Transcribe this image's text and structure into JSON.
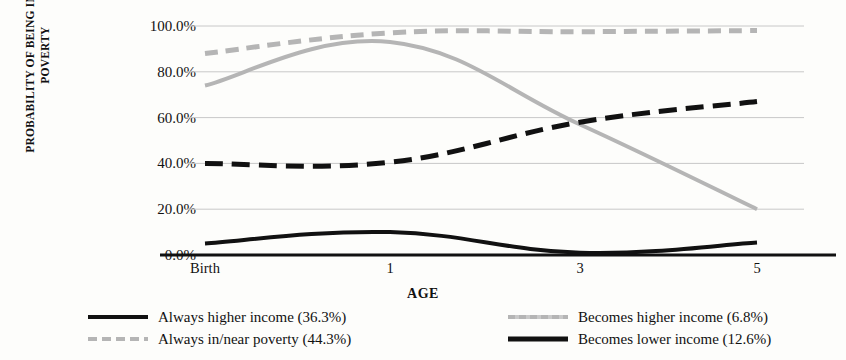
{
  "axes": {
    "y_title_line1": "PROBABILITY OF BEING IN/NEAR",
    "y_title_line2": "POVERTY",
    "x_title": "AGE",
    "y_ticks": [
      "100.0%",
      "80.0%",
      "60.0%",
      "40.0%",
      "20.0%",
      "0.0%"
    ],
    "x_ticks": [
      "Birth",
      "1",
      "3",
      "5"
    ]
  },
  "legend": {
    "left": [
      {
        "label": "Always higher income (36.3%)",
        "style": "sw-black-solid"
      },
      {
        "label": "Always in/near poverty (44.3%)",
        "style": "sw-gray-dash"
      }
    ],
    "right": [
      {
        "label": "Becomes higher income (6.8%)",
        "style": "sw-gray-solid"
      },
      {
        "label": "Becomes lower income (12.6%)",
        "style": "sw-black-dash"
      }
    ]
  },
  "chart_data": {
    "type": "line",
    "title": "",
    "xlabel": "AGE",
    "ylabel": "PROBABILITY OF BEING IN/NEAR POVERTY",
    "x": [
      0,
      1,
      3,
      5
    ],
    "x_tick_labels": [
      "Birth",
      "1",
      "3",
      "5"
    ],
    "ylim": [
      0,
      100
    ],
    "y_ticks": [
      0,
      20,
      40,
      60,
      80,
      100
    ],
    "y_unit": "percent",
    "grid": "horizontal",
    "legend_position": "bottom",
    "series": [
      {
        "name": "Always higher income (36.3%)",
        "share": 36.3,
        "color": "#111111",
        "dash": "solid",
        "values": [
          5.0,
          10.0,
          1.0,
          5.5
        ]
      },
      {
        "name": "Always in/near poverty (44.3%)",
        "share": 44.3,
        "color": "#b5b5b5",
        "dash": "dashed",
        "values": [
          88.0,
          97.0,
          97.5,
          98.0
        ]
      },
      {
        "name": "Becomes higher income (6.8%)",
        "share": 6.8,
        "color": "#b5b5b5",
        "dash": "solid",
        "values": [
          74.0,
          93.0,
          57.0,
          20.0
        ]
      },
      {
        "name": "Becomes lower income (12.6%)",
        "share": 12.6,
        "color": "#111111",
        "dash": "dashed",
        "values": [
          40.0,
          40.5,
          58.0,
          67.0
        ]
      }
    ]
  }
}
